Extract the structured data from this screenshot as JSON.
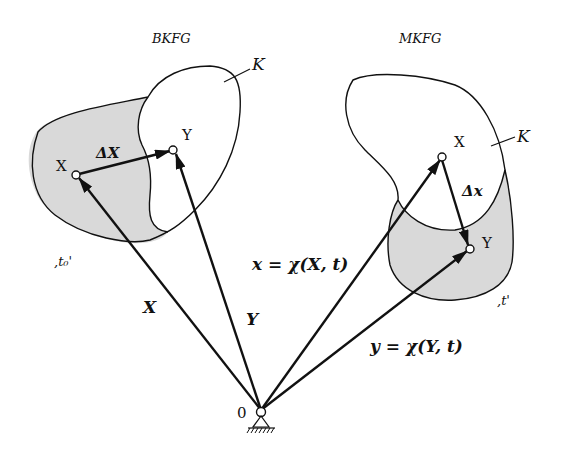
{
  "diagram": {
    "left_config": {
      "title": "BKFG",
      "body_label": "K",
      "time_label": ",t₀'",
      "point_X": "X",
      "point_Y": "Y",
      "delta_label": "ΔX"
    },
    "right_config": {
      "title": "MKFG",
      "body_label": "K",
      "time_label": ",t'",
      "point_X": "X",
      "point_Y": "Y",
      "delta_label": "Δx"
    },
    "vectors": {
      "X": "X",
      "Y": "Y",
      "x_eq": "x = χ(X, t)",
      "y_eq": "y = χ(Y, t)"
    },
    "origin_label": "0",
    "colors": {
      "line": "#111111",
      "shade": "#d9d9d9",
      "background": "#ffffff"
    }
  }
}
